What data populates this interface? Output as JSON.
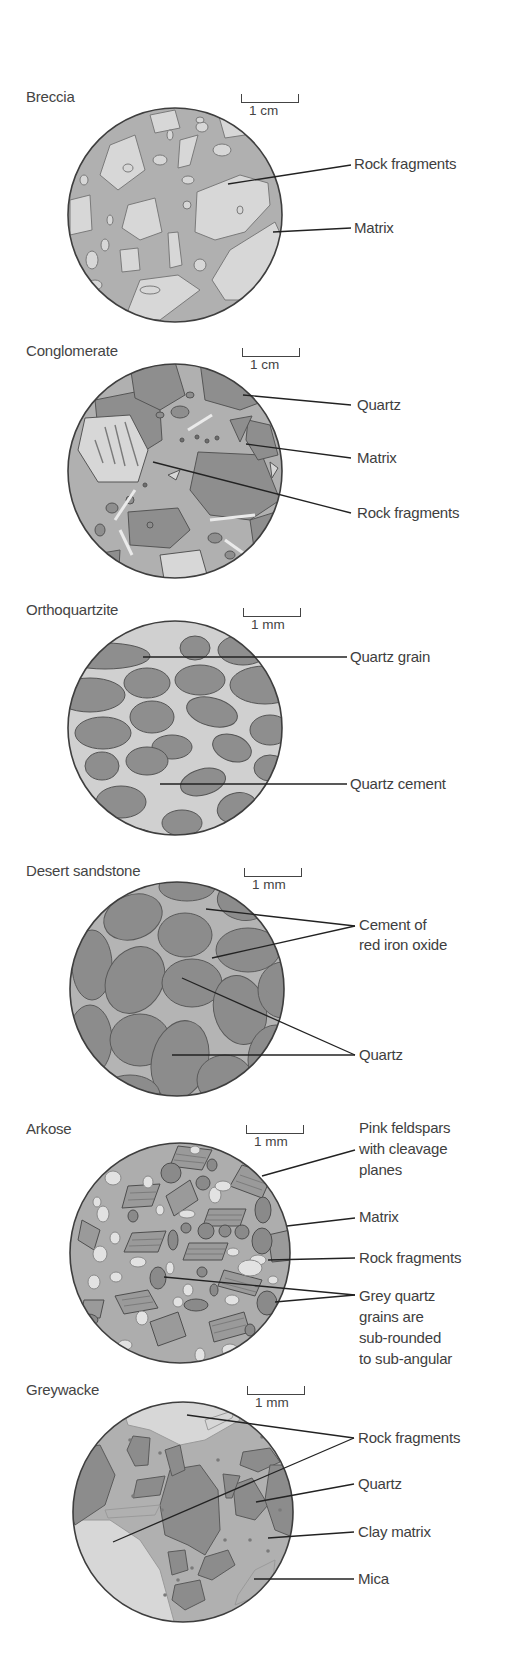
{
  "colors": {
    "background": "#ffffff",
    "outline": "#4a4a4a",
    "dark_grain": "#8e8e8e",
    "matrix": "#b0b0b0",
    "light_fragment": "#d7d7d7",
    "leader_line": "#222222"
  },
  "panels": [
    {
      "id": "breccia",
      "title": "Breccia",
      "scale": "1 cm",
      "labels": [
        "Rock fragments",
        "Matrix"
      ]
    },
    {
      "id": "conglomerate",
      "title": "Conglomerate",
      "scale": "1 cm",
      "labels": [
        "Quartz",
        "Matrix",
        "Rock fragments"
      ]
    },
    {
      "id": "orthoquartzite",
      "title": "Orthoquartzite",
      "scale": "1 mm",
      "labels": [
        "Quartz grain",
        "Quartz cement"
      ]
    },
    {
      "id": "desert-sandstone",
      "title": "Desert sandstone",
      "scale": "1 mm",
      "labels": [
        "Cement of",
        "red iron oxide",
        "Quartz"
      ]
    },
    {
      "id": "arkose",
      "title": "Arkose",
      "scale": "1 mm",
      "labels": [
        "Pink feldspars",
        "with cleavage",
        "planes",
        "Matrix",
        "Rock fragments",
        "Grey quartz",
        "grains are",
        "sub-rounded",
        "to sub-angular"
      ]
    },
    {
      "id": "greywacke",
      "title": "Greywacke",
      "scale": "1 mm",
      "labels": [
        "Rock fragments",
        "Quartz",
        "Clay matrix",
        "Mica"
      ]
    }
  ]
}
